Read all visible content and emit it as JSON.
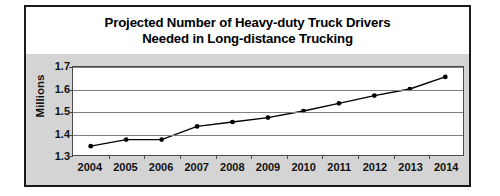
{
  "figure": {
    "title_lines": [
      "Projected Number of Heavy-duty Truck Drivers",
      "Needed in Long-distance Trucking"
    ],
    "colors": {
      "frame_border": "#1a1a1a",
      "title_background": "#ffffff",
      "chart_background": "#d4d4d4",
      "plot_background": "#ffffff",
      "gridline": "#808080",
      "axis_line": "#4a4a4a",
      "series_line": "#000000",
      "marker_fill": "#000000",
      "text": "#111111"
    }
  },
  "chart_data": {
    "type": "line",
    "title": "Projected Number of Heavy-duty Truck Drivers Needed in Long-distance Trucking",
    "xlabel": "",
    "ylabel": "Millions",
    "categories": [
      "2004",
      "2005",
      "2006",
      "2007",
      "2008",
      "2009",
      "2010",
      "2011",
      "2012",
      "2013",
      "2014"
    ],
    "values": [
      1.34,
      1.37,
      1.37,
      1.43,
      1.45,
      1.47,
      1.5,
      1.535,
      1.57,
      1.6,
      1.655
    ],
    "series": [
      {
        "name": "Heavy-duty truck drivers needed",
        "values": [
          1.34,
          1.37,
          1.37,
          1.43,
          1.45,
          1.47,
          1.5,
          1.535,
          1.57,
          1.6,
          1.655
        ]
      }
    ],
    "ylim": [
      1.3,
      1.7
    ],
    "ytick_labels": [
      "1.7",
      "1.6",
      "1.5",
      "1.4",
      "1.3"
    ],
    "ytick_values": [
      1.7,
      1.6,
      1.5,
      1.4,
      1.3
    ],
    "grid": true,
    "grid_axis": "y",
    "legend": false,
    "legend_position": "none",
    "marker": "circle",
    "units": "Millions"
  }
}
